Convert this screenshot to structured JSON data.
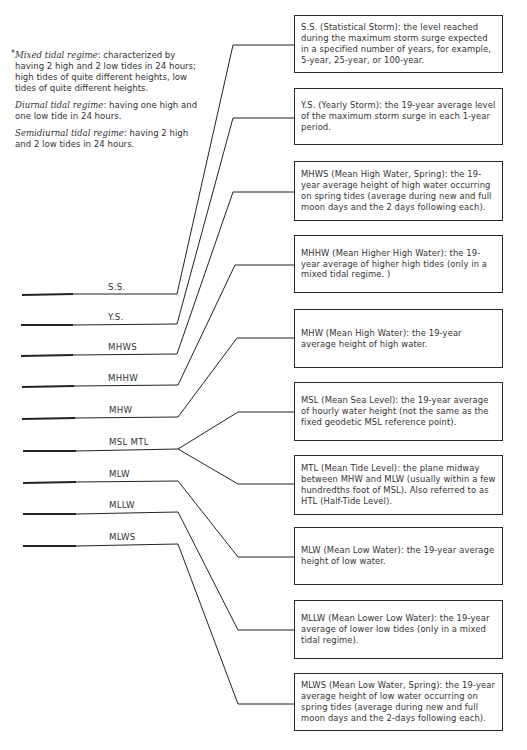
{
  "notes": {
    "mixed": {
      "term": "Mixed tidal regime",
      "text": ": characterized by having 2 high and 2 low tides in 24 hours; high tides of quite different heights, low tides of quite different heights."
    },
    "diurnal": {
      "term": "Diurnal tidal regime",
      "text": ": having one high and one low tide in 24 hours."
    },
    "semidiurnal": {
      "term": "Semidiurnal tidal regime",
      "text": ": having 2 high and 2 low tides in 24 hours."
    },
    "asterisk": "*"
  },
  "levels": [
    {
      "label": "S.S."
    },
    {
      "label": "Y.S."
    },
    {
      "label": "MHWS"
    },
    {
      "label": "MHHW"
    },
    {
      "label": "MHW"
    },
    {
      "label": "MSL MTL"
    },
    {
      "label": "MLW"
    },
    {
      "label": "MLLW"
    },
    {
      "label": "MLWS"
    }
  ],
  "definitions": [
    {
      "text": "S.S. (Statistical Storm): the level reached during the maximum storm surge expected in a specified number of years, for example, 5-year, 25-year, or 100-year."
    },
    {
      "text": "Y.S. (Yearly Storm): the 19-year average level of the maximum storm surge in each 1-year period."
    },
    {
      "text": "MHWS (Mean High Water, Spring): the 19-year average height of high water occurring on spring tides (average during new and full moon days and the 2 days following each)."
    },
    {
      "text": "MHHW (Mean Higher High Water): the 19-year average of higher high tides (only in a mixed tidal regime. )"
    },
    {
      "text": "MHW (Mean High Water): the 19-year average height of high water."
    },
    {
      "text": "MSL (Mean Sea Level): the 19-year average of hourly water height (not the same as the fixed geodetic MSL reference point)."
    },
    {
      "text": "MTL (Mean Tide Level): the plane midway between MHW and MLW (usually within a few hundredths foot of MSL). Also referred to as HTL (Half-Tide Level)."
    },
    {
      "text": "MLW (Mean Low Water): the 19-year average height of low water."
    },
    {
      "text": "MLLW (Mean Lower Low Water): the 19-year average of lower low tides (only in a mixed tidal regime)."
    },
    {
      "text": "MLWS (Mean Low Water, Spring): the 19-year average height of low water occurring on spring tides (average during new and full moon days and the 2-days following each)."
    }
  ]
}
